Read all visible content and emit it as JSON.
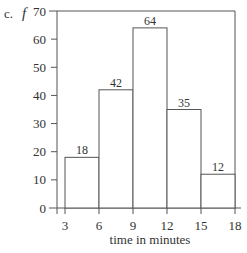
{
  "label": {
    "part": "c.",
    "ylabel": "f"
  },
  "chart_data": {
    "type": "bar",
    "title": "",
    "xlabel": "time in minutes",
    "ylabel": "f",
    "bin_edges": [
      3,
      6,
      9,
      12,
      15,
      18
    ],
    "categories": [
      "3-6",
      "6-9",
      "9-12",
      "12-15",
      "15-18"
    ],
    "values": [
      18,
      42,
      64,
      35,
      12
    ],
    "data_labels": [
      "18",
      "42",
      "64",
      "35",
      "12"
    ],
    "xticks": [
      3,
      6,
      9,
      12,
      15,
      18
    ],
    "xtick_labels": [
      "3",
      "6",
      "9",
      "12",
      "15",
      "18"
    ],
    "yticks": [
      0,
      10,
      20,
      30,
      40,
      50,
      60,
      70
    ],
    "ytick_labels": [
      "0",
      "10",
      "20",
      "30",
      "40",
      "50",
      "60",
      "70"
    ],
    "ylim": [
      0,
      70
    ],
    "xlim": [
      2.3,
      18
    ],
    "grid": false,
    "legend": null,
    "bar_fill": "#ffffff",
    "line_color": "#555555"
  }
}
